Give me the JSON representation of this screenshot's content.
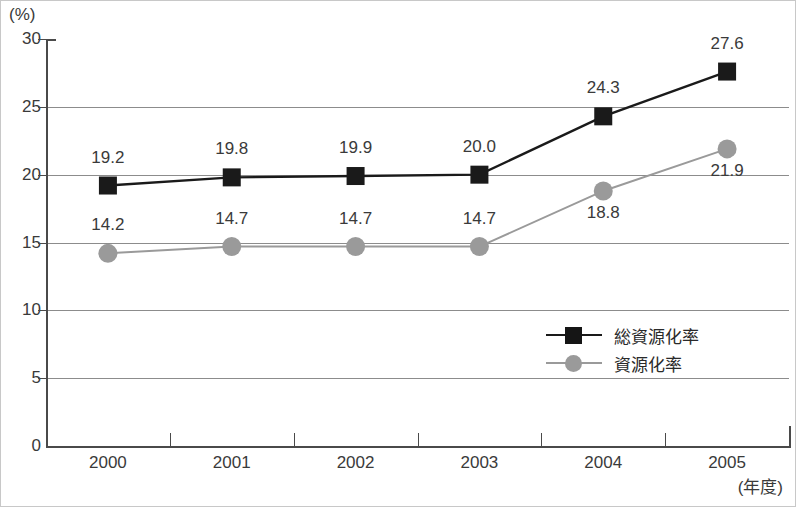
{
  "chart_data": {
    "type": "line",
    "title": "",
    "xlabel": "(年度)",
    "ylabel": "(%)",
    "categories": [
      "2000",
      "2001",
      "2002",
      "2003",
      "2004",
      "2005"
    ],
    "ylim": [
      0,
      30
    ],
    "ytick_values": [
      0,
      5,
      10,
      15,
      20,
      25,
      30
    ],
    "ytick_labels": [
      "0",
      "5",
      "10",
      "15",
      "20",
      "25",
      "30"
    ],
    "grid": true,
    "legend_position": "inside-right",
    "series": [
      {
        "name": "総資源化率",
        "color": "#1a1a1a",
        "marker": "square",
        "values": [
          19.2,
          19.8,
          19.9,
          20.0,
          24.3,
          27.6
        ],
        "labels": [
          "19.2",
          "19.8",
          "19.9",
          "20.0",
          "24.3",
          "27.6"
        ],
        "label_positions": [
          "above",
          "above",
          "above",
          "above",
          "above",
          "above"
        ]
      },
      {
        "name": "資源化率",
        "color": "#9a9a9a",
        "marker": "circle",
        "values": [
          14.2,
          14.7,
          14.7,
          14.7,
          18.8,
          21.9
        ],
        "labels": [
          "14.2",
          "14.7",
          "14.7",
          "14.7",
          "18.8",
          "21.9"
        ],
        "label_positions": [
          "above",
          "above",
          "above",
          "above",
          "below",
          "below"
        ]
      }
    ]
  },
  "axes": {
    "y_unit": "(%)",
    "x_unit": "(年度)"
  },
  "legend": {
    "items": [
      {
        "label": "総資源化率",
        "marker": "square-marker",
        "color": "#1a1a1a"
      },
      {
        "label": "資源化率",
        "marker": "circle-marker",
        "color": "#9a9a9a"
      }
    ]
  }
}
